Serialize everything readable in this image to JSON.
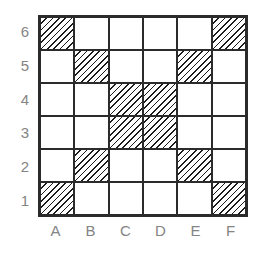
{
  "board": {
    "columns": [
      "A",
      "B",
      "C",
      "D",
      "E",
      "F"
    ],
    "rows": [
      "6",
      "5",
      "4",
      "3",
      "2",
      "1"
    ],
    "hatched_cells": [
      "A6",
      "F6",
      "B5",
      "E5",
      "C4",
      "D4",
      "C3",
      "D3",
      "B2",
      "E2",
      "A1",
      "F1"
    ]
  },
  "colors": {
    "background": "#ffffff",
    "grid_line": "#2b2b2b",
    "hatch_line": "#1c1c1c",
    "label_text": "#848484"
  }
}
